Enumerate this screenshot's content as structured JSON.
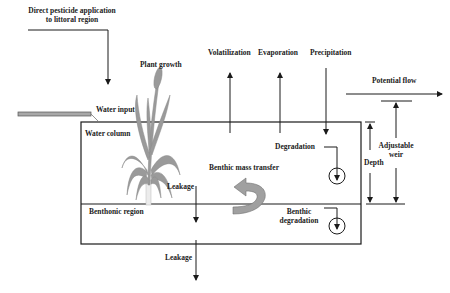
{
  "diagram": {
    "type": "process-diagram",
    "labels": {
      "direct_application_line1": "Direct pesticide application",
      "direct_application_line2": "to littoral region",
      "plant_growth": "Plant growth",
      "volatilization": "Volatilization",
      "evaporation": "Evaporation",
      "precipitation": "Precipitation",
      "potential_flow": "Potential flow",
      "water_input": "Water input",
      "water_column": "Water column",
      "degradation": "Degradation",
      "adjustable_weir_line1": "Adjustable",
      "adjustable_weir_line2": "weir",
      "depth": "Depth",
      "benthic_mass_transfer": "Benthic mass transfer",
      "leakage_upper": "Leakage",
      "benthonic_region": "Benthonic region",
      "benthic_degradation_line1": "Benthic",
      "benthic_degradation_line2": "degradation",
      "leakage_lower": "Leakage"
    },
    "colors": {
      "line": "#1a1a1a",
      "plant": "#9a9a9a",
      "plant_base": "#e8e8e8",
      "pipe": "#a8a8a8",
      "curved_arrow": "#a0a0a0",
      "text": "#222222"
    },
    "nodes": [
      {
        "id": "water-column",
        "label": "Water column"
      },
      {
        "id": "benthonic-region",
        "label": "Benthonic region"
      }
    ],
    "edges": [
      {
        "from": "external",
        "to": "water-column",
        "label": "Direct pesticide application to littoral region"
      },
      {
        "from": "external",
        "to": "water-column",
        "label": "Water input"
      },
      {
        "from": "water-column",
        "to": "atmosphere",
        "label": "Volatilization"
      },
      {
        "from": "water-column",
        "to": "atmosphere",
        "label": "Evaporation"
      },
      {
        "from": "atmosphere",
        "to": "water-column",
        "label": "Precipitation"
      },
      {
        "from": "water-column",
        "to": "outflow",
        "label": "Potential flow"
      },
      {
        "from": "water-column",
        "to": "degradation",
        "label": "Degradation"
      },
      {
        "from": "benthonic-region",
        "to": "water-column",
        "label": "Benthic mass transfer"
      },
      {
        "from": "water-column",
        "to": "benthonic-region",
        "label": "Leakage"
      },
      {
        "from": "benthonic-region",
        "to": "benthic-degradation",
        "label": "Benthic degradation"
      },
      {
        "from": "benthonic-region",
        "to": "below",
        "label": "Leakage"
      }
    ]
  }
}
